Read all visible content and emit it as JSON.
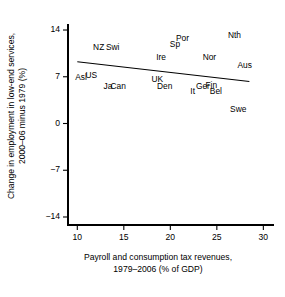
{
  "chart_data": {
    "type": "scatter",
    "title": "",
    "xlabel": "Payroll and consumption tax revenues, 1979–2006 (% of GDP)",
    "xlabel_line1": "Payroll and consumption tax revenues,",
    "xlabel_line2": "1979–2006 (% of GDP)",
    "ylabel": "Change in employment in low-end services, 2000–06 minus 1979 (%)",
    "ylabel_line1": "Change in employment in low-end services,",
    "ylabel_line2": "2000–06 minus 1979 (%)",
    "xlim": [
      9,
      30.5
    ],
    "ylim": [
      -15.2,
      15.2
    ],
    "xticks": [
      10,
      15,
      20,
      25,
      30
    ],
    "xtick_labels": [
      "10",
      "15",
      "20",
      "25",
      "30"
    ],
    "yticks": [
      14,
      7,
      0,
      -7,
      -14
    ],
    "ytick_labels": [
      "14",
      "7",
      "0",
      "−7",
      "−14"
    ],
    "grid": false,
    "legend": "none",
    "marker_style": "text-label-only",
    "points": [
      {
        "label": "Asl",
        "x": 10.4,
        "y": 6.9
      },
      {
        "label": "US",
        "x": 11.5,
        "y": 7.3
      },
      {
        "label": "NZ",
        "x": 12.3,
        "y": 11.5
      },
      {
        "label": "Ja",
        "x": 13.3,
        "y": 5.6
      },
      {
        "label": "Swi",
        "x": 13.8,
        "y": 11.5
      },
      {
        "label": "Can",
        "x": 14.4,
        "y": 5.6
      },
      {
        "label": "UK",
        "x": 18.6,
        "y": 6.6
      },
      {
        "label": "Ire",
        "x": 19.0,
        "y": 9.9
      },
      {
        "label": "Den",
        "x": 19.4,
        "y": 5.6
      },
      {
        "label": "Sp",
        "x": 20.5,
        "y": 11.9
      },
      {
        "label": "Por",
        "x": 21.3,
        "y": 12.8
      },
      {
        "label": "It",
        "x": 22.4,
        "y": 4.9
      },
      {
        "label": "Ger",
        "x": 23.5,
        "y": 5.6
      },
      {
        "label": "Nor",
        "x": 24.2,
        "y": 10.0
      },
      {
        "label": "Fin",
        "x": 24.4,
        "y": 5.8
      },
      {
        "label": "Bel",
        "x": 24.9,
        "y": 4.9
      },
      {
        "label": "Nth",
        "x": 26.9,
        "y": 13.2
      },
      {
        "label": "Swe",
        "x": 27.3,
        "y": 2.2
      },
      {
        "label": "Aus",
        "x": 28.0,
        "y": 8.8
      }
    ],
    "fit_line": {
      "type": "linear",
      "x_start": 10.0,
      "y_start": 9.25,
      "x_end": 28.5,
      "y_end": 6.3,
      "color": "#000000"
    },
    "colors": {
      "axis": "#000000",
      "text": "#000000",
      "background": "#ffffff",
      "fit_line": "#000000"
    }
  }
}
